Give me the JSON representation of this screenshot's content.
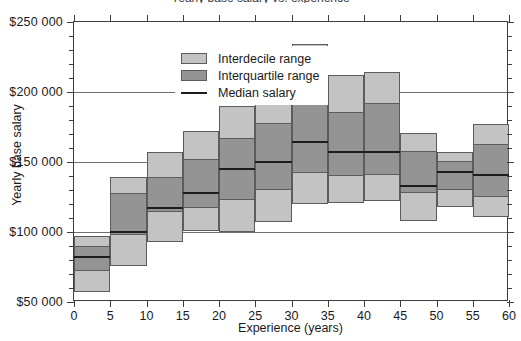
{
  "chart_data": {
    "type": "bar",
    "title": "Yearly base salary vs. experience",
    "xlabel": "Experience (years)",
    "ylabel": "Yearly base salary",
    "xlim": [
      0,
      60
    ],
    "ylim": [
      50000,
      250000
    ],
    "xticks": [
      "0",
      "5",
      "10",
      "15",
      "20",
      "25",
      "30",
      "35",
      "40",
      "45",
      "50",
      "55",
      "60"
    ],
    "xtick_values": [
      0,
      5,
      10,
      15,
      20,
      25,
      30,
      35,
      40,
      45,
      50,
      55,
      60
    ],
    "yticks": [
      "$50 000",
      "$100 000",
      "$150 000",
      "$200 000",
      "$250 000"
    ],
    "ytick_values": [
      50000,
      100000,
      150000,
      200000,
      250000
    ],
    "y_minor_step": 10000,
    "grid": "horizontal-major",
    "legend_position": "top-left",
    "legend": [
      {
        "label": "Interdecile range",
        "marker": "filled-box",
        "color": "#c3c3c3"
      },
      {
        "label": "Interquartile range",
        "marker": "filled-box",
        "color": "#949494"
      },
      {
        "label": "Median salary",
        "marker": "line",
        "color": "#1d1d1d"
      }
    ],
    "categories": [
      "0-5",
      "5-10",
      "10-15",
      "15-20",
      "20-25",
      "25-30",
      "30-35",
      "35-40",
      "40-45",
      "45-50",
      "50-55",
      "55-60"
    ],
    "bins": [
      {
        "x0": 0,
        "x1": 5,
        "d1": 57000,
        "q1": 72000,
        "median": 82000,
        "q3": 90000,
        "d9": 97000
      },
      {
        "x0": 5,
        "x1": 10,
        "d1": 76000,
        "q1": 98000,
        "median": 100000,
        "q3": 128000,
        "d9": 139000
      },
      {
        "x0": 10,
        "x1": 15,
        "d1": 93000,
        "q1": 114000,
        "median": 117000,
        "q3": 139000,
        "d9": 157000
      },
      {
        "x0": 15,
        "x1": 20,
        "d1": 101000,
        "q1": 117000,
        "median": 128000,
        "q3": 152000,
        "d9": 172000
      },
      {
        "x0": 20,
        "x1": 25,
        "d1": 100000,
        "q1": 123000,
        "median": 145000,
        "q3": 167000,
        "d9": 190000
      },
      {
        "x0": 25,
        "x1": 30,
        "d1": 107000,
        "q1": 130000,
        "median": 150000,
        "q3": 178000,
        "d9": 221000
      },
      {
        "x0": 30,
        "x1": 35,
        "d1": 120000,
        "q1": 142000,
        "median": 164000,
        "q3": 193000,
        "d9": 234000
      },
      {
        "x0": 35,
        "x1": 40,
        "d1": 121000,
        "q1": 140000,
        "median": 157000,
        "q3": 186000,
        "d9": 212000
      },
      {
        "x0": 40,
        "x1": 45,
        "d1": 122000,
        "q1": 141000,
        "median": 157000,
        "q3": 192000,
        "d9": 214000
      },
      {
        "x0": 45,
        "x1": 50,
        "d1": 108000,
        "q1": 128000,
        "median": 133000,
        "q3": 158000,
        "d9": 171000
      },
      {
        "x0": 50,
        "x1": 55,
        "d1": 118000,
        "q1": 130000,
        "median": 143000,
        "q3": 151000,
        "d9": 157000
      },
      {
        "x0": 55,
        "x1": 60,
        "d1": 111000,
        "q1": 125000,
        "median": 141000,
        "q3": 163000,
        "d9": 177000
      }
    ],
    "series": [
      {
        "name": "Interdecile range",
        "values": [
          40000,
          63000,
          64000,
          71000,
          90000,
          114000,
          114000,
          91000,
          92000,
          63000,
          39000,
          66000
        ]
      },
      {
        "name": "Interquartile range",
        "values": [
          18000,
          30000,
          25000,
          35000,
          44000,
          48000,
          51000,
          46000,
          51000,
          30000,
          21000,
          38000
        ]
      },
      {
        "name": "Median salary",
        "values": [
          82000,
          100000,
          117000,
          128000,
          145000,
          150000,
          164000,
          157000,
          157000,
          133000,
          143000,
          141000
        ]
      }
    ]
  }
}
